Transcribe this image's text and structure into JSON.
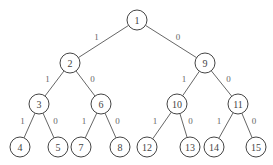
{
  "diagram": {
    "type": "binary-tree",
    "nodes": [
      {
        "id": "1",
        "label": "1",
        "x": 137,
        "y": 20
      },
      {
        "id": "2",
        "label": "2",
        "x": 70,
        "y": 63
      },
      {
        "id": "9",
        "label": "9",
        "x": 205,
        "y": 63
      },
      {
        "id": "3",
        "label": "3",
        "x": 39,
        "y": 104
      },
      {
        "id": "6",
        "label": "6",
        "x": 101,
        "y": 104
      },
      {
        "id": "10",
        "label": "10",
        "x": 177,
        "y": 104
      },
      {
        "id": "11",
        "label": "11",
        "x": 238,
        "y": 104
      },
      {
        "id": "4",
        "label": "4",
        "x": 20,
        "y": 147
      },
      {
        "id": "5",
        "label": "5",
        "x": 58,
        "y": 147
      },
      {
        "id": "7",
        "label": "7",
        "x": 81,
        "y": 147
      },
      {
        "id": "8",
        "label": "8",
        "x": 120,
        "y": 147
      },
      {
        "id": "12",
        "label": "12",
        "x": 147,
        "y": 147
      },
      {
        "id": "13",
        "label": "13",
        "x": 190,
        "y": 147
      },
      {
        "id": "14",
        "label": "14",
        "x": 214,
        "y": 147
      },
      {
        "id": "15",
        "label": "15",
        "x": 256,
        "y": 147
      }
    ],
    "edges": [
      {
        "from": "1",
        "to": "2",
        "label": "1"
      },
      {
        "from": "1",
        "to": "9",
        "label": "0"
      },
      {
        "from": "2",
        "to": "3",
        "label": "1"
      },
      {
        "from": "2",
        "to": "6",
        "label": "0"
      },
      {
        "from": "9",
        "to": "10",
        "label": "1"
      },
      {
        "from": "9",
        "to": "11",
        "label": "0"
      },
      {
        "from": "3",
        "to": "4",
        "label": "1"
      },
      {
        "from": "3",
        "to": "5",
        "label": "0"
      },
      {
        "from": "6",
        "to": "7",
        "label": "1"
      },
      {
        "from": "6",
        "to": "8",
        "label": "0"
      },
      {
        "from": "10",
        "to": "12",
        "label": "1"
      },
      {
        "from": "10",
        "to": "13",
        "label": "0"
      },
      {
        "from": "11",
        "to": "14",
        "label": "1"
      },
      {
        "from": "11",
        "to": "15",
        "label": "0"
      }
    ]
  }
}
